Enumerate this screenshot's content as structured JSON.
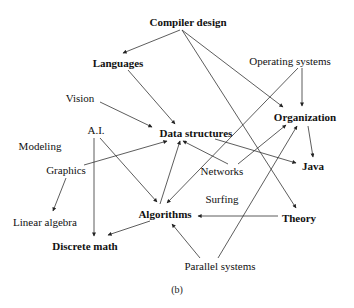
{
  "diagram": {
    "caption": "(b)",
    "colors": {
      "edge": "#333333",
      "text": "#111111",
      "background": "#ffffff"
    },
    "nodes": [
      {
        "id": "compiler",
        "label": "Compiler design",
        "bold": true,
        "x": 188,
        "y": 22
      },
      {
        "id": "languages",
        "label": "Languages",
        "bold": true,
        "x": 118,
        "y": 63
      },
      {
        "id": "opsys",
        "label": "Operating systems",
        "bold": false,
        "x": 290,
        "y": 61
      },
      {
        "id": "vision",
        "label": "Vision",
        "bold": false,
        "x": 80,
        "y": 98
      },
      {
        "id": "organization",
        "label": "Organization",
        "bold": true,
        "x": 305,
        "y": 117
      },
      {
        "id": "ai",
        "label": "A.I.",
        "bold": false,
        "x": 96,
        "y": 130
      },
      {
        "id": "datastructures",
        "label": "Data structures",
        "bold": true,
        "x": 196,
        "y": 133
      },
      {
        "id": "modeling",
        "label": "Modeling",
        "bold": false,
        "x": 40,
        "y": 146
      },
      {
        "id": "graphics",
        "label": "Graphics",
        "bold": false,
        "x": 66,
        "y": 170
      },
      {
        "id": "networks",
        "label": "Networks",
        "bold": false,
        "x": 222,
        "y": 171
      },
      {
        "id": "java",
        "label": "Java",
        "bold": true,
        "x": 313,
        "y": 166
      },
      {
        "id": "surfing",
        "label": "Surfing",
        "bold": false,
        "x": 222,
        "y": 199
      },
      {
        "id": "linalg",
        "label": "Linear algebra",
        "bold": false,
        "x": 45,
        "y": 222
      },
      {
        "id": "algorithms",
        "label": "Algorithms",
        "bold": true,
        "x": 165,
        "y": 214
      },
      {
        "id": "theory",
        "label": "Theory",
        "bold": true,
        "x": 299,
        "y": 218
      },
      {
        "id": "discrete",
        "label": "Discrete math",
        "bold": true,
        "x": 85,
        "y": 246
      },
      {
        "id": "parallel",
        "label": "Parallel systems",
        "bold": false,
        "x": 220,
        "y": 266
      }
    ],
    "edges": [
      {
        "from": "compiler",
        "to": "languages",
        "x1": 180,
        "y1": 30,
        "x2": 123,
        "y2": 53
      },
      {
        "from": "compiler",
        "to": "organization",
        "x1": 182,
        "y1": 30,
        "x2": 283,
        "y2": 107
      },
      {
        "from": "compiler",
        "to": "theory",
        "x1": 182,
        "y1": 30,
        "x2": 296,
        "y2": 208
      },
      {
        "from": "languages",
        "to": "datastructures",
        "x1": 128,
        "y1": 70,
        "x2": 175,
        "y2": 124
      },
      {
        "from": "vision",
        "to": "datastructures",
        "x1": 100,
        "y1": 102,
        "x2": 152,
        "y2": 127
      },
      {
        "from": "graphics",
        "to": "datastructures",
        "x1": 84,
        "y1": 165,
        "x2": 167,
        "y2": 141
      },
      {
        "from": "graphics",
        "to": "linalg",
        "x1": 66,
        "y1": 178,
        "x2": 53,
        "y2": 211
      },
      {
        "from": "ai",
        "to": "discrete",
        "x1": 94,
        "y1": 138,
        "x2": 94,
        "y2": 236
      },
      {
        "from": "ai",
        "to": "algorithms",
        "x1": 100,
        "y1": 138,
        "x2": 157,
        "y2": 202
      },
      {
        "from": "networks",
        "to": "datastructures",
        "x1": 228,
        "y1": 164,
        "x2": 183,
        "y2": 141
      },
      {
        "from": "networks",
        "to": "organization",
        "x1": 238,
        "y1": 164,
        "x2": 286,
        "y2": 125
      },
      {
        "from": "datastructures",
        "to": "java",
        "x1": 215,
        "y1": 139,
        "x2": 296,
        "y2": 163
      },
      {
        "from": "opsys",
        "to": "organization",
        "x1": 302,
        "y1": 68,
        "x2": 302,
        "y2": 106
      },
      {
        "from": "opsys",
        "to": "algorithms",
        "x1": 298,
        "y1": 68,
        "x2": 167,
        "y2": 203
      },
      {
        "from": "organization",
        "to": "java",
        "x1": 308,
        "y1": 126,
        "x2": 313,
        "y2": 157
      },
      {
        "from": "algorithms",
        "to": "datastructures",
        "x1": 160,
        "y1": 204,
        "x2": 180,
        "y2": 141
      },
      {
        "from": "algorithms",
        "to": "discrete",
        "x1": 150,
        "y1": 221,
        "x2": 108,
        "y2": 235
      },
      {
        "from": "theory",
        "to": "algorithms",
        "x1": 278,
        "y1": 216,
        "x2": 198,
        "y2": 216
      },
      {
        "from": "parallel",
        "to": "algorithms",
        "x1": 200,
        "y1": 258,
        "x2": 172,
        "y2": 224
      },
      {
        "from": "parallel",
        "to": "organization",
        "x1": 218,
        "y1": 258,
        "x2": 297,
        "y2": 126
      }
    ]
  }
}
